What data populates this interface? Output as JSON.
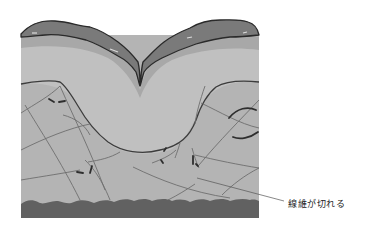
{
  "figure": {
    "colors": {
      "background": "#ffffff",
      "epidermis_outer": "#7a7a7a",
      "epidermis_outline": "#2a2a2a",
      "epidermis_inner": "#a9a9a9",
      "upper_layer": "#bdbdbd",
      "dermis": "#b3b3b3",
      "dermis_lower": "#b0b0b0",
      "fiber": "#6e6e6e",
      "broken_fiber": "#2e2e2e",
      "base_layer": "#616161",
      "callout_line": "#555555"
    }
  },
  "annotation": {
    "label": "線維が切れる"
  }
}
